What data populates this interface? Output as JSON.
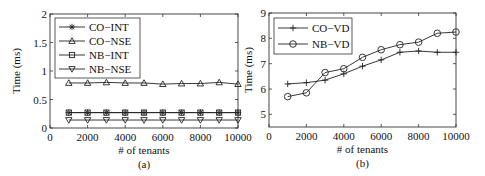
{
  "chart_data": [
    {
      "type": "line",
      "panel_label": "(a)",
      "title": "",
      "xlabel": "# of tenants",
      "ylabel": "Time (ms)",
      "xlim": [
        0,
        10000
      ],
      "ylim": [
        0,
        2
      ],
      "xticks": [
        0,
        2000,
        4000,
        6000,
        8000,
        10000
      ],
      "xtick_labels": [
        "0",
        "2000",
        "4000",
        "6000",
        "8000",
        "10000"
      ],
      "yticks": [
        0,
        0.5,
        1,
        1.5,
        2
      ],
      "ytick_labels": [
        "0",
        "0.5",
        "1",
        "1.5",
        "2"
      ],
      "grid": false,
      "legend_position": "upper left",
      "x": [
        1000,
        2000,
        3000,
        4000,
        5000,
        6000,
        7000,
        8000,
        9000,
        10000
      ],
      "series": [
        {
          "name": "CO−INT",
          "marker": "asterisk",
          "values": [
            0.27,
            0.27,
            0.27,
            0.27,
            0.27,
            0.27,
            0.27,
            0.27,
            0.27,
            0.27
          ]
        },
        {
          "name": "CO−NSE",
          "marker": "triangle-up",
          "values": [
            0.79,
            0.79,
            0.8,
            0.79,
            0.79,
            0.77,
            0.78,
            0.78,
            0.8,
            0.77
          ]
        },
        {
          "name": "NB−INT",
          "marker": "square",
          "values": [
            0.27,
            0.27,
            0.27,
            0.27,
            0.27,
            0.27,
            0.27,
            0.27,
            0.27,
            0.27
          ]
        },
        {
          "name": "NB−NSE",
          "marker": "triangle-down",
          "values": [
            0.14,
            0.14,
            0.14,
            0.14,
            0.14,
            0.14,
            0.14,
            0.14,
            0.14,
            0.14
          ]
        }
      ]
    },
    {
      "type": "line",
      "panel_label": "(b)",
      "title": "",
      "xlabel": "# of tenants",
      "ylabel": "Time (ms)",
      "xlim": [
        0,
        10000
      ],
      "ylim": [
        4.5,
        9
      ],
      "xticks": [
        0,
        2000,
        4000,
        6000,
        8000,
        10000
      ],
      "xtick_labels": [
        "0",
        "2000",
        "4000",
        "6000",
        "8000",
        "10000"
      ],
      "yticks": [
        5,
        6,
        7,
        8,
        9
      ],
      "ytick_labels": [
        "5",
        "6",
        "7",
        "8",
        "9"
      ],
      "grid": false,
      "legend_position": "upper left",
      "x": [
        1000,
        2000,
        3000,
        4000,
        5000,
        6000,
        7000,
        8000,
        9000,
        10000
      ],
      "series": [
        {
          "name": "CO−VD",
          "marker": "plus",
          "values": [
            6.2,
            6.25,
            6.35,
            6.6,
            6.9,
            7.15,
            7.45,
            7.5,
            7.45,
            7.45
          ]
        },
        {
          "name": "NB−VD",
          "marker": "circle",
          "values": [
            5.7,
            5.85,
            6.65,
            6.8,
            7.25,
            7.55,
            7.75,
            7.85,
            8.2,
            8.25
          ]
        }
      ]
    }
  ]
}
